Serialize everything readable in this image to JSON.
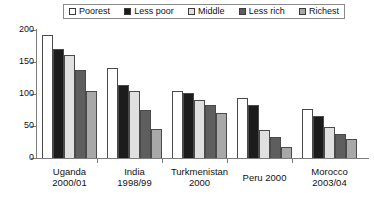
{
  "legend": {
    "position": "top",
    "entries": [
      {
        "label": "Poorest",
        "color": "#ffffff"
      },
      {
        "label": "Less poor",
        "color": "#1c1c1c"
      },
      {
        "label": "Middle",
        "color": "#e0e0e0"
      },
      {
        "label": "Less rich",
        "color": "#5e5e5e"
      },
      {
        "label": "Richest",
        "color": "#a8a8a8"
      }
    ]
  },
  "axis": {
    "y_ticks": [
      "0",
      "50",
      "100",
      "150",
      "200"
    ]
  },
  "chart_data": {
    "type": "bar",
    "title": "",
    "subtitle": "",
    "xlabel": "",
    "ylabel": "",
    "ylim": [
      0,
      200
    ],
    "ytick_values": [
      0,
      50,
      100,
      150,
      200
    ],
    "grid": false,
    "legend_position": "top",
    "categories": [
      "Uganda\n2000/01",
      "India\n1998/99",
      "Turkmenistan\n2000",
      "Peru 2000",
      "Morocco\n2003/04"
    ],
    "category_lines": [
      [
        "Uganda",
        "2000/01"
      ],
      [
        "India",
        "1998/99"
      ],
      [
        "Turkmenistan",
        "2000"
      ],
      [
        "Peru 2000",
        ""
      ],
      [
        "Morocco",
        "2003/04"
      ]
    ],
    "series": [
      {
        "name": "Poorest",
        "color": "#ffffff",
        "values": [
          192,
          141,
          105,
          94,
          76
        ]
      },
      {
        "name": "Less poor",
        "color": "#1c1c1c",
        "values": [
          170,
          114,
          101,
          83,
          65
        ]
      },
      {
        "name": "Middle",
        "color": "#e0e0e0",
        "values": [
          161,
          104,
          90,
          44,
          48
        ]
      },
      {
        "name": "Less rich",
        "color": "#5e5e5e",
        "values": [
          137,
          75,
          83,
          33,
          38
        ]
      },
      {
        "name": "Richest",
        "color": "#a8a8a8",
        "values": [
          105,
          46,
          71,
          17,
          30
        ]
      }
    ]
  }
}
